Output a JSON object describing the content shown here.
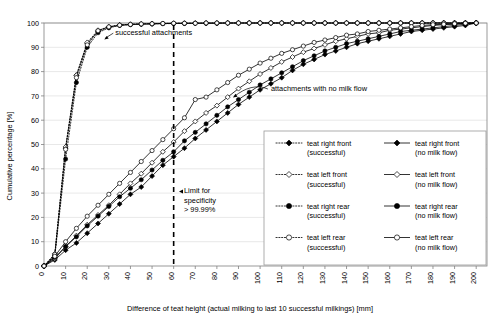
{
  "chart_data": {
    "type": "line",
    "title": "",
    "xlabel": "Difference of teat height (actual milking to last 10 successful milkings) [mm]",
    "ylabel": "Cumulative percentage [%]",
    "xlim": [
      0,
      205
    ],
    "ylim": [
      0,
      100
    ],
    "xticks": [
      0,
      10,
      20,
      30,
      40,
      50,
      60,
      70,
      80,
      90,
      100,
      110,
      120,
      130,
      140,
      150,
      160,
      170,
      180,
      190,
      200
    ],
    "yticks": [
      0,
      10,
      20,
      30,
      40,
      50,
      60,
      70,
      80,
      90,
      100
    ],
    "grid": "horizontal",
    "legend_position": "inside-bottom-right",
    "x": [
      0,
      5,
      10,
      15,
      20,
      25,
      30,
      35,
      40,
      45,
      50,
      55,
      60,
      65,
      70,
      75,
      80,
      85,
      90,
      95,
      100,
      105,
      110,
      115,
      120,
      125,
      130,
      135,
      140,
      145,
      150,
      155,
      160,
      165,
      170,
      175,
      180,
      185,
      190,
      195,
      200
    ],
    "series": [
      {
        "name": "teat right front (successful)",
        "marker": "filled-diamond",
        "line": "dotted",
        "values": [
          0,
          4.5,
          48.5,
          78.5,
          91.5,
          96.5,
          98.3,
          99.1,
          99.4,
          99.6,
          99.7,
          99.8,
          99.8,
          99.9,
          99.9,
          99.9,
          99.9,
          100,
          100,
          100,
          100,
          100,
          100,
          100,
          100,
          100,
          100,
          100,
          100,
          100,
          100,
          100,
          100,
          100,
          100,
          100,
          100,
          100,
          100,
          100,
          100
        ]
      },
      {
        "name": "teat left front (successful)",
        "marker": "open-diamond",
        "line": "dotted",
        "values": [
          0,
          5.0,
          49.0,
          78.5,
          92.0,
          97.0,
          98.5,
          99.2,
          99.5,
          99.6,
          99.7,
          99.8,
          99.9,
          99.9,
          99.9,
          100,
          100,
          100,
          100,
          100,
          100,
          100,
          100,
          100,
          100,
          100,
          100,
          100,
          100,
          100,
          100,
          100,
          100,
          100,
          100,
          100,
          100,
          100,
          100,
          100,
          100
        ]
      },
      {
        "name": "teat right rear (successful)",
        "marker": "filled-circle",
        "line": "dotted",
        "values": [
          0,
          4.0,
          44.0,
          75.5,
          90.0,
          96.0,
          98.0,
          99.0,
          99.3,
          99.5,
          99.6,
          99.7,
          99.8,
          99.8,
          99.9,
          99.9,
          99.9,
          100,
          100,
          100,
          100,
          100,
          100,
          100,
          100,
          100,
          100,
          100,
          100,
          100,
          100,
          100,
          100,
          100,
          100,
          100,
          100,
          100,
          100,
          100,
          100
        ]
      },
      {
        "name": "teat left rear (successful)",
        "marker": "open-circle",
        "line": "dotted",
        "values": [
          0,
          4.8,
          48.0,
          77.5,
          91.0,
          96.8,
          98.4,
          99.1,
          99.4,
          99.6,
          99.7,
          99.8,
          99.9,
          99.9,
          99.9,
          100,
          100,
          100,
          100,
          100,
          100,
          100,
          100,
          100,
          100,
          100,
          100,
          100,
          100,
          100,
          100,
          100,
          100,
          100,
          100,
          100,
          100,
          100,
          100,
          100,
          100
        ]
      },
      {
        "name": "teat right front (no milk flow)",
        "marker": "filled-diamond",
        "line": "solid",
        "values": [
          0,
          2.5,
          6.5,
          9.5,
          13.5,
          17.5,
          21.5,
          25.5,
          29.5,
          32.5,
          37.0,
          41.5,
          45.0,
          48.5,
          52.5,
          56.0,
          59.5,
          63.0,
          66.5,
          69.5,
          72.5,
          75.0,
          77.5,
          80.5,
          83.0,
          85.0,
          87.0,
          88.5,
          90.0,
          91.5,
          92.5,
          93.5,
          94.5,
          95.5,
          96.5,
          97.0,
          97.5,
          98.0,
          98.5,
          99.0,
          100
        ]
      },
      {
        "name": "teat left front (no milk flow)",
        "marker": "open-diamond",
        "line": "solid",
        "values": [
          0,
          3.0,
          8.0,
          12.5,
          17.0,
          21.0,
          25.0,
          29.5,
          34.0,
          38.0,
          42.5,
          47.0,
          51.0,
          55.5,
          59.5,
          63.0,
          66.0,
          69.5,
          73.0,
          76.0,
          79.0,
          81.5,
          84.0,
          86.0,
          88.0,
          89.5,
          91.0,
          92.5,
          93.5,
          94.5,
          95.5,
          96.0,
          97.0,
          97.5,
          98.0,
          98.5,
          99.0,
          99.3,
          99.5,
          99.8,
          100
        ]
      },
      {
        "name": "teat right rear (no milk flow)",
        "marker": "filled-circle",
        "line": "solid",
        "values": [
          0,
          3.5,
          8.0,
          12.0,
          16.5,
          20.5,
          24.5,
          28.5,
          32.0,
          35.5,
          39.5,
          43.5,
          47.0,
          51.5,
          55.0,
          58.5,
          62.0,
          65.5,
          68.5,
          71.5,
          74.5,
          77.0,
          79.5,
          82.0,
          84.5,
          86.5,
          88.5,
          90.0,
          91.5,
          92.5,
          93.5,
          94.5,
          95.5,
          96.5,
          97.0,
          97.5,
          98.0,
          98.5,
          99.0,
          99.5,
          100
        ]
      },
      {
        "name": "teat left rear (no milk flow)",
        "marker": "open-circle",
        "line": "solid",
        "values": [
          0,
          4.0,
          10.0,
          15.5,
          20.5,
          25.0,
          29.5,
          34.0,
          38.5,
          43.0,
          47.5,
          52.0,
          56.5,
          61.0,
          68.5,
          69.5,
          72.5,
          75.5,
          78.5,
          81.0,
          83.5,
          85.5,
          87.5,
          89.0,
          90.5,
          92.0,
          93.0,
          94.0,
          95.0,
          95.5,
          96.5,
          97.0,
          97.5,
          98.0,
          98.5,
          99.0,
          99.3,
          99.5,
          99.7,
          99.9,
          100
        ]
      }
    ],
    "annotations": [
      {
        "text": "successful attachments",
        "x": 33,
        "y": 95
      },
      {
        "text": "attachments with no milk flow",
        "x": 105,
        "y": 72
      },
      {
        "text_lines": [
          "Limit for",
          "specificity",
          "> 99.99%"
        ],
        "x": 62,
        "y": 30
      }
    ],
    "reference_line": {
      "x": 60,
      "style": "dashed",
      "label": "Limit for specificity > 99.99%"
    }
  },
  "legend": {
    "column_left_header": "successful",
    "column_right_header": "no milk flow",
    "rows": [
      {
        "left_label_1": "teat right front",
        "left_label_2": "(successful)",
        "left_marker": "filled-diamond",
        "left_line": "dotted",
        "right_label_1": "teat right front",
        "right_label_2": "(no milk flow)",
        "right_marker": "filled-diamond",
        "right_line": "solid"
      },
      {
        "left_label_1": "teat left front",
        "left_label_2": "(successful)",
        "left_marker": "open-diamond",
        "left_line": "dotted",
        "right_label_1": "teat left front",
        "right_label_2": "(no milk flow)",
        "right_marker": "open-diamond",
        "right_line": "solid"
      },
      {
        "left_label_1": "teat right rear",
        "left_label_2": "(successful)",
        "left_marker": "filled-circle",
        "left_line": "dotted",
        "right_label_1": "teat right rear",
        "right_label_2": "(no milk flow)",
        "right_marker": "filled-circle",
        "right_line": "solid"
      },
      {
        "left_label_1": "teat left rear",
        "left_label_2": "(successful)",
        "left_marker": "open-circle",
        "left_line": "dotted",
        "right_label_1": "teat left rear",
        "right_label_2": "(no milk flow)",
        "right_marker": "open-circle",
        "right_line": "solid"
      }
    ]
  },
  "colors": {
    "ink": "#000000",
    "grid": "#d9d9d9",
    "frame": "#808080",
    "background": "#ffffff"
  }
}
